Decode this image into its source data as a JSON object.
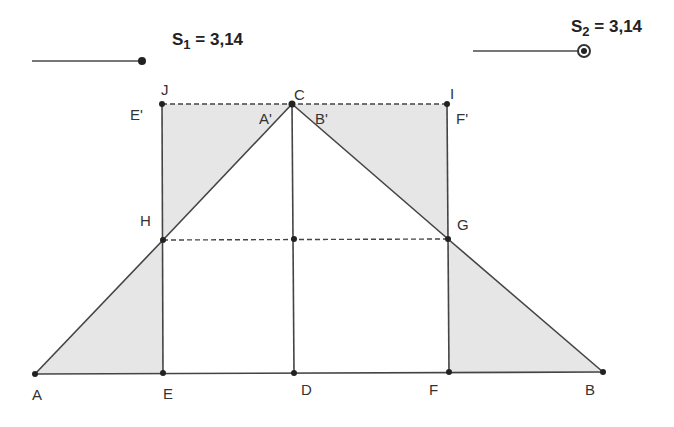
{
  "sliders": [
    {
      "id": "S1",
      "name": "S",
      "subscript": "1",
      "equals": " = ",
      "value": "3,14",
      "track": {
        "x1": 32,
        "x2": 142,
        "y": 61
      },
      "handle": {
        "x": 142,
        "y": 61,
        "style": "dot"
      }
    },
    {
      "id": "S2",
      "name": "S",
      "subscript": "2",
      "equals": " = ",
      "value": "3,14",
      "track": {
        "x1": 473,
        "x2": 584,
        "y": 51
      },
      "handle": {
        "x": 584,
        "y": 51,
        "style": "ring"
      }
    }
  ],
  "points": {
    "A": {
      "x": 35,
      "y": 374,
      "label": "A",
      "lx": 32,
      "ly": 387
    },
    "E": {
      "x": 163,
      "y": 373,
      "label": "E",
      "lx": 163,
      "ly": 386
    },
    "D": {
      "x": 294,
      "y": 373,
      "label": "D",
      "lx": 301,
      "ly": 382
    },
    "F": {
      "x": 449,
      "y": 372,
      "label": "F",
      "lx": 429,
      "ly": 382
    },
    "B": {
      "x": 603,
      "y": 372,
      "label": "B",
      "lx": 585,
      "ly": 382
    },
    "H": {
      "x": 163,
      "y": 240,
      "label": "H",
      "lx": 140,
      "ly": 213
    },
    "G": {
      "x": 448,
      "y": 239,
      "label": "G",
      "lx": 457,
      "ly": 217
    },
    "M": {
      "x": 294,
      "y": 239,
      "label": ""
    },
    "J": {
      "x": 162,
      "y": 104,
      "label": "J",
      "lx": 161,
      "ly": 82
    },
    "C": {
      "x": 292,
      "y": 104,
      "label": "C",
      "lx": 294,
      "ly": 87
    },
    "I": {
      "x": 447,
      "y": 104,
      "label": "I",
      "lx": 450,
      "ly": 86
    }
  },
  "extra_labels": [
    {
      "text": "E'",
      "x": 130,
      "y": 107
    },
    {
      "text": "A'",
      "x": 259,
      "y": 111
    },
    {
      "text": "B'",
      "x": 315,
      "y": 111
    },
    {
      "text": "F'",
      "x": 456,
      "y": 111
    }
  ],
  "shaded_regions": [
    {
      "name": "triangle-AEH",
      "pts": [
        "A",
        "E",
        "H"
      ]
    },
    {
      "name": "triangle-FBG",
      "pts": [
        "F",
        "B",
        "G"
      ]
    },
    {
      "name": "triangle-JCH",
      "pts": [
        "J",
        "C",
        "H"
      ]
    },
    {
      "name": "triangle-CIG",
      "pts": [
        "C",
        "I",
        "G"
      ]
    }
  ],
  "colors": {
    "fill": "#e6e6e6",
    "stroke": "#444444",
    "point": "#222222",
    "slider_track": "#777777"
  }
}
